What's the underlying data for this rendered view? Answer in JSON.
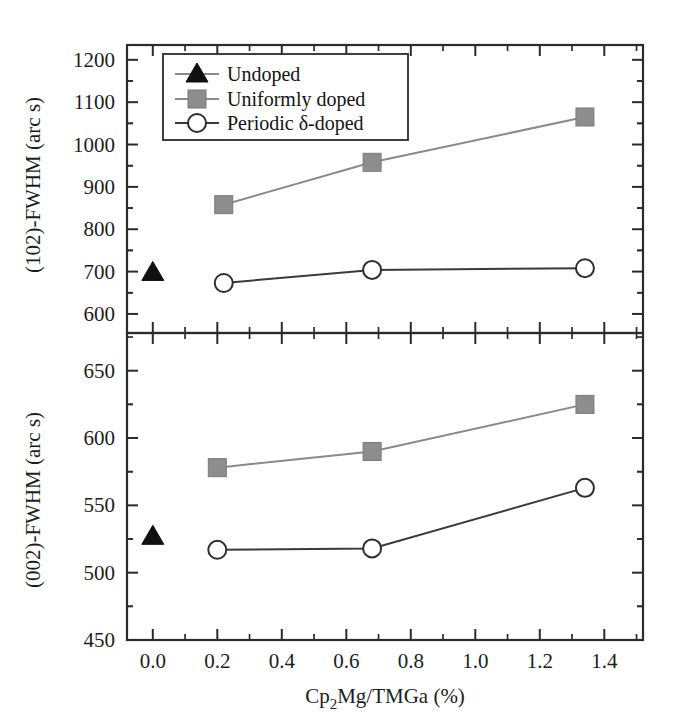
{
  "figure": {
    "background": "#ffffff",
    "axis_color": "#2b2b2b"
  },
  "legend": {
    "position": "top-left-upper-panel",
    "entries": [
      {
        "label": "Undoped",
        "marker": "triangle-filled",
        "color": "#101010"
      },
      {
        "label": "Uniformly doped",
        "marker": "square-filled",
        "color": "#8d8d8d"
      },
      {
        "label": "Periodic δ-doped",
        "marker": "circle-open",
        "color": "#2e2e2e"
      }
    ]
  },
  "axes": {
    "x": {
      "label": "Cp₂Mg/TMGa (%)",
      "label_parts": {
        "pre": "Cp",
        "sub": "2",
        "post": "Mg/TMGa (%)"
      },
      "ticks": [
        "0.0",
        "0.2",
        "0.4",
        "0.6",
        "0.8",
        "1.0",
        "1.2",
        "1.4"
      ],
      "min": -0.08,
      "max": 1.52,
      "minor_per_major": 2
    },
    "y_top": {
      "label": "(102)-FWHM (arc s)",
      "ticks": [
        "600",
        "700",
        "800",
        "900",
        "1000",
        "1100",
        "1200"
      ],
      "min": 555,
      "max": 1235,
      "minor_per_major": 2
    },
    "y_bottom": {
      "label": "(002)-FWHM (arc s)",
      "ticks": [
        "450",
        "500",
        "550",
        "600",
        "650"
      ],
      "min": 450,
      "max": 678,
      "minor_per_major": 2
    }
  },
  "chart_data": [
    {
      "type": "line",
      "panel": "top",
      "title": "",
      "xlabel": "Cp2Mg/TMGa (%)",
      "ylabel": "(102)-FWHM (arc s)",
      "xlim": [
        -0.08,
        1.52
      ],
      "ylim": [
        555,
        1235
      ],
      "grid": false,
      "legend_position": "upper left",
      "series": [
        {
          "name": "Undoped",
          "marker": "triangle-filled",
          "color": "#101010",
          "line": false,
          "x": [
            0.0
          ],
          "y": [
            698
          ]
        },
        {
          "name": "Uniformly doped",
          "marker": "square-filled",
          "color": "#8d8d8d",
          "line": true,
          "x": [
            0.22,
            0.68,
            1.34
          ],
          "y": [
            858,
            958,
            1065
          ]
        },
        {
          "name": "Periodic δ-doped",
          "marker": "circle-open",
          "color": "#2e2e2e",
          "line": true,
          "x": [
            0.22,
            0.68,
            1.34
          ],
          "y": [
            673,
            704,
            708
          ]
        }
      ]
    },
    {
      "type": "line",
      "panel": "bottom",
      "title": "",
      "xlabel": "Cp2Mg/TMGa (%)",
      "ylabel": "(002)-FWHM (arc s)",
      "xlim": [
        -0.08,
        1.52
      ],
      "ylim": [
        450,
        678
      ],
      "grid": false,
      "legend_position": "none",
      "series": [
        {
          "name": "Undoped",
          "marker": "triangle-filled",
          "color": "#101010",
          "line": false,
          "x": [
            0.0
          ],
          "y": [
            527
          ]
        },
        {
          "name": "Uniformly doped",
          "marker": "square-filled",
          "color": "#8d8d8d",
          "line": true,
          "x": [
            0.2,
            0.68,
            1.34
          ],
          "y": [
            578,
            590,
            625
          ]
        },
        {
          "name": "Periodic δ-doped",
          "marker": "circle-open",
          "color": "#2e2e2e",
          "line": true,
          "x": [
            0.2,
            0.68,
            1.34
          ],
          "y": [
            517,
            518,
            563
          ]
        }
      ]
    }
  ]
}
